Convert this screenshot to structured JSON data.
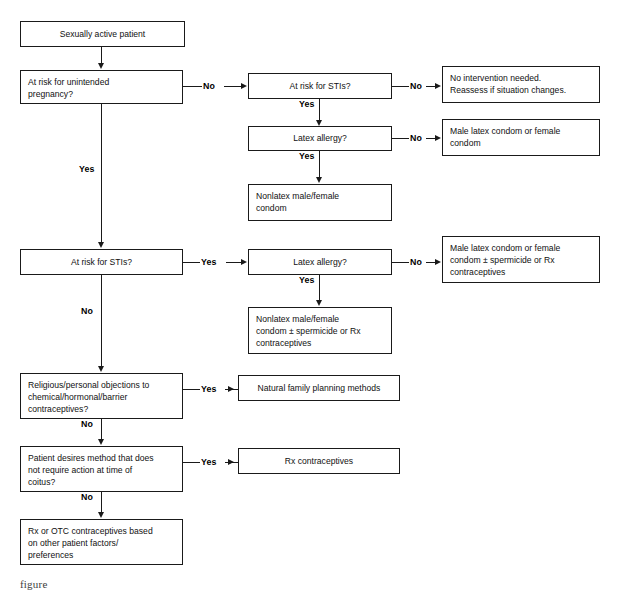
{
  "figure": {
    "type": "decision-flowchart",
    "caption": "figure"
  },
  "nodes": {
    "start": "Sexually active patient",
    "q_unintended_pregnancy": "At risk for unintended\npregnancy?",
    "q_sti_top": "At risk for STIs?",
    "out_no_intervention": "No intervention needed.\nReassess if situation changes.",
    "q_latex_top": "Latex allergy?",
    "out_male_latex_condom": "Male latex condom or female\ncondom",
    "out_nonlatex_condom": "Nonlatex male/female\ncondom",
    "q_sti_mid": "At risk for STIs?",
    "q_latex_mid": "Latex allergy?",
    "out_male_latex_spermicide": "Male latex condom or female\ncondom ± spermicide or Rx\ncontraceptives",
    "out_nonlatex_spermicide": "Nonlatex male/female\ncondom ± spermicide or Rx\ncontraceptives",
    "q_objections": "Religious/personal objections to\nchemical/hormonal/barrier\ncontraceptives?",
    "out_natural_family_planning": "Natural family planning methods",
    "q_no_coitus_action": "Patient desires method that does\nnot require action at time of\ncoitus?",
    "out_rx_contraceptives": "Rx contraceptives",
    "out_rx_or_otc": "Rx or OTC contraceptives based\non other patient factors/\npreferences"
  },
  "edges": {
    "yes": "Yes",
    "no": "No"
  },
  "edge_labels": {
    "pregnancy_no": "No",
    "pregnancy_yes": "Yes",
    "sti_top_no": "No",
    "sti_top_yes": "Yes",
    "latex_top_no": "No",
    "latex_top_yes": "Yes",
    "sti_mid_yes": "Yes",
    "sti_mid_no": "No",
    "latex_mid_no": "No",
    "latex_mid_yes": "Yes",
    "objections_yes": "Yes",
    "objections_no": "No",
    "coitus_yes": "Yes",
    "coitus_no": "No"
  },
  "colors": {
    "border": "#1a1a1a",
    "text": "#111111",
    "background": "#ffffff"
  }
}
